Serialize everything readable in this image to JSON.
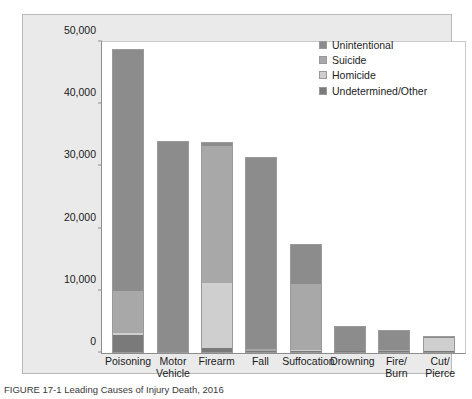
{
  "figure": {
    "caption": "FIGURE 17-1  Leading Causes of Injury Death, 2016"
  },
  "legend": {
    "position": "top-right",
    "items": [
      {
        "label": "Unintentional",
        "color": "#8c8c8c"
      },
      {
        "label": "Suicide",
        "color": "#a8a8a8"
      },
      {
        "label": "Homicide",
        "color": "#cfcfcf"
      },
      {
        "label": "Undetermined/Other",
        "color": "#7a7a7a"
      }
    ]
  },
  "chart_data": {
    "type": "bar",
    "subtype": "stacked",
    "title": "",
    "xlabel": "",
    "ylabel": "Number of Deaths",
    "ylim": [
      0,
      50000
    ],
    "yticks": [
      "0",
      "10,000",
      "20,000",
      "30,000",
      "40,000",
      "50,000"
    ],
    "ytick_values": [
      0,
      10000,
      20000,
      30000,
      40000,
      50000
    ],
    "grid": false,
    "categories": [
      "Poisoning",
      "Motor Vehicle",
      "Firearm",
      "Fall",
      "Suffocation",
      "Drowning",
      "Fire/Burn",
      "Cut/Pierce"
    ],
    "category_lines": [
      {
        "l1": "Poisoning",
        "l2": ""
      },
      {
        "l1": "Motor",
        "l2": "Vehicle"
      },
      {
        "l1": "Firearm",
        "l2": ""
      },
      {
        "l1": "Fall",
        "l2": ""
      },
      {
        "l1": "Suffocation",
        "l2": ""
      },
      {
        "l1": "Drowning",
        "l2": ""
      },
      {
        "l1": "Fire/",
        "l2": "Burn"
      },
      {
        "l1": "Cut/",
        "l2": "Pierce"
      }
    ],
    "series": [
      {
        "name": "Unintentional",
        "color": "#8c8c8c",
        "values": [
          38700,
          33800,
          500,
          30700,
          6200,
          3800,
          3000,
          200
        ]
      },
      {
        "name": "Suicide",
        "color": "#a8a8a8",
        "values": [
          6800,
          0,
          22000,
          300,
          10600,
          0,
          100,
          0
        ]
      },
      {
        "name": "Homicide",
        "color": "#cfcfcf",
        "values": [
          300,
          0,
          10500,
          0,
          200,
          0,
          0,
          2000
        ]
      },
      {
        "name": "Undetermined/Other",
        "color": "#7a7a7a",
        "values": [
          2700,
          0,
          600,
          200,
          100,
          100,
          100,
          200
        ]
      }
    ],
    "totals": [
      48500,
      33800,
      33600,
      31200,
      17100,
      3900,
      3200,
      2400
    ]
  }
}
